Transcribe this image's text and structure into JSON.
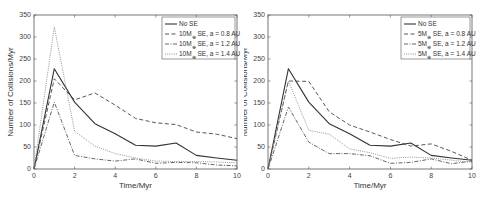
{
  "chart_data": [
    {
      "type": "line",
      "title": "",
      "xlabel": "Time/Myr",
      "ylabel": "Number of Collisions/Myr",
      "xlim": [
        0,
        10
      ],
      "ylim": [
        0,
        350
      ],
      "xticks": [
        0,
        2,
        4,
        6,
        8,
        10
      ],
      "yticks": [
        0,
        50,
        100,
        150,
        200,
        250,
        300,
        350
      ],
      "grid": false,
      "legend_position": "upper right",
      "x": [
        0,
        1,
        2,
        3,
        4,
        5,
        6,
        7,
        8,
        9,
        10
      ],
      "series": [
        {
          "name": "No SE",
          "style": "solid",
          "color": "#333333",
          "values": [
            0,
            228,
            152,
            103,
            80,
            54,
            52,
            59,
            31,
            25,
            20
          ]
        },
        {
          "name": "10M⊕ SE, a = 0.8 AU",
          "style": "dashed",
          "color": "#444444",
          "values": [
            0,
            205,
            157,
            173,
            145,
            115,
            105,
            101,
            84,
            79,
            69
          ]
        },
        {
          "name": "10M⊕ SE, a = 1.2 AU",
          "style": "dashdot",
          "color": "#555555",
          "values": [
            0,
            152,
            31,
            23,
            18,
            23,
            13,
            15,
            14,
            9,
            7
          ]
        },
        {
          "name": "10M⊕ SE, a = 1.4 AU",
          "style": "dotted",
          "color": "#888888",
          "values": [
            0,
            323,
            86,
            52,
            35,
            25,
            18,
            17,
            17,
            16,
            14
          ]
        }
      ],
      "legend": [
        {
          "prefix": "No SE",
          "sub": "",
          "suffix": ""
        },
        {
          "prefix": "10M",
          "sub": "⊕",
          "suffix": " SE, a = 0.8 AU"
        },
        {
          "prefix": "10M",
          "sub": "⊕",
          "suffix": " SE, a = 1.2 AU"
        },
        {
          "prefix": "10M",
          "sub": "⊕",
          "suffix": " SE, a = 1.4 AU"
        }
      ]
    },
    {
      "type": "line",
      "title": "",
      "xlabel": "Time/Myr",
      "ylabel": "Number of Collisions/Myr",
      "xlim": [
        0,
        10
      ],
      "ylim": [
        0,
        350
      ],
      "xticks": [
        0,
        2,
        4,
        6,
        8,
        10
      ],
      "yticks": [
        0,
        50,
        100,
        150,
        200,
        250,
        300,
        350
      ],
      "grid": false,
      "legend_position": "upper right",
      "x": [
        0,
        1,
        2,
        3,
        4,
        5,
        6,
        7,
        8,
        9,
        10
      ],
      "series": [
        {
          "name": "No SE",
          "style": "solid",
          "color": "#333333",
          "values": [
            0,
            228,
            152,
            103,
            80,
            54,
            52,
            59,
            31,
            25,
            20
          ]
        },
        {
          "name": "5M⊕ SE, a = 0.8 AU",
          "style": "dashed",
          "color": "#444444",
          "values": [
            0,
            200,
            199,
            130,
            100,
            84,
            67,
            52,
            57,
            40,
            20
          ]
        },
        {
          "name": "5M⊕ SE, a = 1.2 AU",
          "style": "dashdot",
          "color": "#555555",
          "values": [
            0,
            141,
            61,
            35,
            35,
            30,
            13,
            15,
            23,
            12,
            18
          ]
        },
        {
          "name": "5M⊕ SE, a = 1.4 AU",
          "style": "dotted",
          "color": "#888888",
          "values": [
            0,
            200,
            88,
            79,
            46,
            37,
            24,
            27,
            25,
            20,
            15
          ]
        }
      ],
      "legend": [
        {
          "prefix": "No SE",
          "sub": "",
          "suffix": ""
        },
        {
          "prefix": "5M",
          "sub": "⊕",
          "suffix": " SE, a = 0.8 AU"
        },
        {
          "prefix": "5M",
          "sub": "⊕",
          "suffix": " SE, a = 1.2 AU"
        },
        {
          "prefix": "5M",
          "sub": "⊕",
          "suffix": " SE, a = 1.4 AU"
        }
      ]
    }
  ],
  "layout": [
    {
      "left": 0,
      "plot": {
        "x0": 34,
        "x1": 237,
        "y0": 169,
        "y1": 15
      },
      "legend": {
        "x": 162,
        "y": 17,
        "w": 73,
        "h": 42
      }
    },
    {
      "left": 244,
      "plot": {
        "x0": 24,
        "x1": 228,
        "y0": 169,
        "y1": 15
      },
      "legend": {
        "x": 157,
        "y": 17,
        "w": 69,
        "h": 42
      }
    }
  ]
}
